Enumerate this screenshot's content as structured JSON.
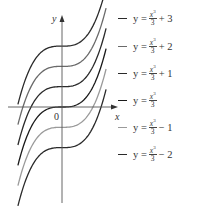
{
  "chart_data": {
    "type": "line",
    "title": "",
    "xlabel": "x",
    "ylabel": "y",
    "origin_label": "0",
    "function_base": "y = x^3/3",
    "x_range": [
      -2.05,
      2.05
    ],
    "grid": false,
    "legend_position": "right",
    "series": [
      {
        "name": "y = x³/3 + 3",
        "shift": 3,
        "color": "#2a2a2a"
      },
      {
        "name": "y = x³/3 + 2",
        "shift": 2,
        "color": "#6a6a6a"
      },
      {
        "name": "y = x³/3 + 1",
        "shift": 1,
        "color": "#2a2a2a"
      },
      {
        "name": "y = x³/3",
        "shift": 0,
        "color": "#1a1a1a"
      },
      {
        "name": "y = x³/3 − 1",
        "shift": -1,
        "color": "#9a9a9a"
      },
      {
        "name": "y = x³/3 − 2",
        "shift": -2,
        "color": "#2a2a2a"
      }
    ]
  },
  "legend": {
    "items": [
      {
        "prefix": "y =",
        "num": "x",
        "exp": "3",
        "den": "3",
        "suffix": "+ 3",
        "color": "#2a2a2a"
      },
      {
        "prefix": "y =",
        "num": "x",
        "exp": "3",
        "den": "3",
        "suffix": "+ 2",
        "color": "#6a6a6a"
      },
      {
        "prefix": "y =",
        "num": "x",
        "exp": "3",
        "den": "3",
        "suffix": "+ 1",
        "color": "#2a2a2a"
      },
      {
        "prefix": "y =",
        "num": "x",
        "exp": "3",
        "den": "3",
        "suffix": "",
        "color": "#1a1a1a"
      },
      {
        "prefix": "y =",
        "num": "x",
        "exp": "3",
        "den": "3",
        "suffix": "− 1",
        "color": "#9a9a9a"
      },
      {
        "prefix": "y =",
        "num": "x",
        "exp": "3",
        "den": "3",
        "suffix": "− 2",
        "color": "#2a2a2a"
      }
    ]
  }
}
